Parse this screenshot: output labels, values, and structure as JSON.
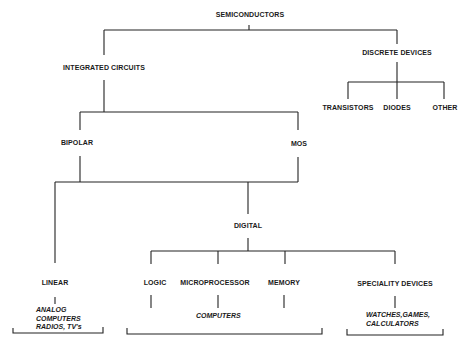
{
  "diagram": {
    "root": "SEMICONDUCTORS",
    "level1": {
      "integrated_circuits": "INTEGRATED CIRCUITS",
      "discrete_devices": "DISCRETE DEVICES"
    },
    "discrete_children": {
      "transistors": "TRANSISTORS",
      "diodes": "DIODES",
      "other": "OTHER"
    },
    "ic_children": {
      "bipolar": "BIPOLAR",
      "mos": "MOS"
    },
    "technology_children": {
      "linear": "LINEAR",
      "digital": "DIGITAL"
    },
    "digital_children": {
      "logic": "LOGIC",
      "microprocessor": "MICROPROCESSOR",
      "memory": "MEMORY",
      "speciality_devices": "SPECIALITY DEVICES"
    },
    "applications": {
      "linear": [
        "ANALOG",
        "COMPUTERS",
        "RADIOS, TV's"
      ],
      "digital": [
        "COMPUTERS"
      ],
      "speciality": [
        "WATCHES,GAMES,",
        "CALCULATORS"
      ]
    }
  }
}
